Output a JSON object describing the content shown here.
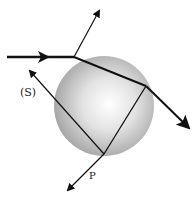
{
  "diagram": {
    "labels": {
      "s": "(S)",
      "p": "P"
    },
    "sphere": {
      "cx": 104,
      "cy": 106,
      "r": 50,
      "fill_center": "#ffffff",
      "fill_edge": "#9a9a9a"
    },
    "colors": {
      "ray": "#111111"
    }
  }
}
